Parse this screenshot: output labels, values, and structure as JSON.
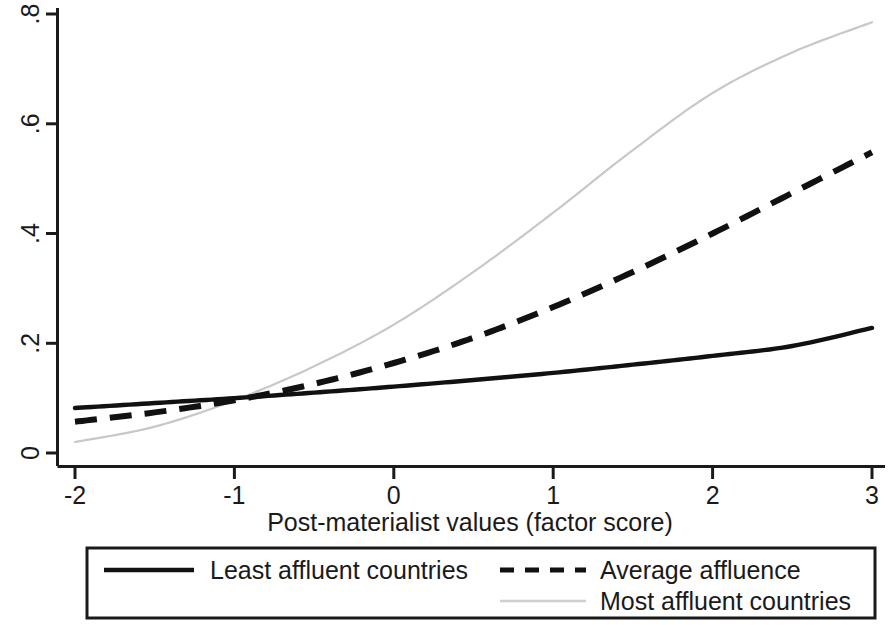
{
  "chart_data": {
    "type": "line",
    "title": "",
    "subtitle": "",
    "xlabel": "Post-materialist values (factor score)",
    "ylabel": "",
    "xlim": [
      -2,
      3
    ],
    "ylim": [
      0,
      0.8
    ],
    "xticks": [
      "-2",
      "-1",
      "0",
      "1",
      "2",
      "3"
    ],
    "xtick_values": [
      -2,
      -1,
      0,
      1,
      2,
      3
    ],
    "yticks": [
      "0",
      ".2",
      ".4",
      ".6",
      ".8"
    ],
    "ytick_values": [
      0,
      0.2,
      0.4,
      0.6,
      0.8
    ],
    "grid": false,
    "legend_position": "bottom",
    "x": [
      -2,
      -1.5,
      -1,
      -0.5,
      0,
      0.5,
      1,
      1.5,
      2,
      2.5,
      3
    ],
    "series": [
      {
        "name": "Least affluent countries",
        "style": "solid",
        "color": "#111111",
        "values": [
          0.082,
          0.091,
          0.1,
          0.11,
          0.121,
          0.133,
          0.146,
          0.161,
          0.177,
          0.195,
          0.228
        ]
      },
      {
        "name": "Average affluence",
        "style": "dashed",
        "color": "#111111",
        "values": [
          0.057,
          0.074,
          0.096,
          0.126,
          0.164,
          0.21,
          0.266,
          0.33,
          0.4,
          0.474,
          0.548
        ]
      },
      {
        "name": "Most affluent countries",
        "style": "light",
        "color": "#c8c8c8",
        "values": [
          0.02,
          0.048,
          0.096,
          0.158,
          0.234,
          0.33,
          0.438,
          0.552,
          0.656,
          0.73,
          0.785
        ]
      }
    ]
  },
  "axes": {
    "x_title": "Post-materialist values (factor score)",
    "x_tick_labels": [
      "-2",
      "-1",
      "0",
      "1",
      "2",
      "3"
    ],
    "y_tick_labels": [
      "0",
      ".2",
      ".4",
      ".6",
      ".8"
    ]
  },
  "legend": {
    "entries": [
      {
        "label": "Least affluent countries",
        "style": "solid"
      },
      {
        "label": "Average affluence",
        "style": "dashed"
      },
      {
        "label": "Most affluent countries",
        "style": "light"
      }
    ]
  }
}
